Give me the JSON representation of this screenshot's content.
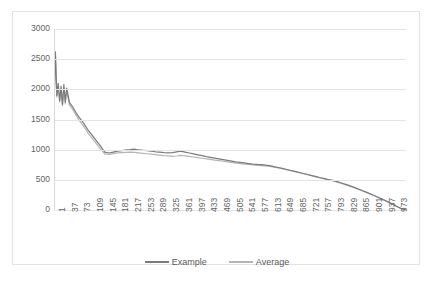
{
  "chart_data": {
    "type": "line",
    "title": "",
    "xlabel": "",
    "ylabel": "",
    "xlim": [
      1,
      1000
    ],
    "ylim": [
      0,
      3000
    ],
    "grid": true,
    "legend_position": "bottom",
    "y_ticks": [
      3000,
      2500,
      2000,
      1500,
      1000,
      500,
      0
    ],
    "x_ticks": [
      1,
      37,
      73,
      109,
      145,
      181,
      217,
      253,
      289,
      325,
      361,
      397,
      433,
      469,
      505,
      541,
      577,
      613,
      649,
      685,
      721,
      757,
      793,
      829,
      865,
      901,
      937,
      973
    ],
    "colors": {
      "example": "#7b7b7b",
      "average": "#b5b5b5",
      "grid": "#e4e4e4",
      "text": "#626262"
    },
    "series": [
      {
        "name": "Example",
        "color": "#7b7b7b",
        "x": [
          1,
          5,
          9,
          13,
          17,
          21,
          25,
          29,
          33,
          37,
          45,
          55,
          65,
          73,
          85,
          97,
          109,
          121,
          133,
          145,
          157,
          169,
          181,
          193,
          205,
          217,
          229,
          241,
          253,
          265,
          277,
          289,
          301,
          313,
          325,
          337,
          349,
          361,
          373,
          385,
          397,
          409,
          421,
          433,
          445,
          457,
          469,
          481,
          493,
          505,
          517,
          529,
          541,
          553,
          565,
          577,
          589,
          601,
          613,
          625,
          637,
          649,
          661,
          673,
          685,
          697,
          709,
          721,
          733,
          745,
          757,
          769,
          781,
          793,
          805,
          817,
          829,
          841,
          853,
          865,
          877,
          889,
          901,
          913,
          925,
          937,
          949,
          961,
          973,
          985,
          997,
          1000
        ],
        "values": [
          1730,
          2620,
          1900,
          2100,
          1810,
          2050,
          1750,
          2080,
          1790,
          2020,
          1780,
          1700,
          1600,
          1530,
          1440,
          1330,
          1240,
          1150,
          1060,
          960,
          945,
          960,
          975,
          985,
          995,
          1000,
          1010,
          995,
          990,
          985,
          975,
          965,
          960,
          952,
          948,
          950,
          962,
          975,
          960,
          945,
          930,
          915,
          900,
          885,
          872,
          860,
          848,
          835,
          822,
          810,
          798,
          790,
          780,
          770,
          760,
          755,
          752,
          745,
          735,
          720,
          705,
          690,
          672,
          655,
          640,
          622,
          605,
          588,
          570,
          552,
          535,
          520,
          502,
          490,
          470,
          448,
          425,
          400,
          375,
          348,
          320,
          292,
          262,
          232,
          200,
          168,
          135,
          100,
          62,
          28,
          5,
          0
        ]
      },
      {
        "name": "Average",
        "color": "#b5b5b5",
        "x": [
          1,
          5,
          9,
          13,
          17,
          21,
          25,
          29,
          33,
          37,
          45,
          55,
          65,
          73,
          85,
          97,
          109,
          121,
          133,
          145,
          157,
          169,
          181,
          193,
          205,
          217,
          229,
          241,
          253,
          265,
          277,
          289,
          301,
          313,
          325,
          337,
          349,
          361,
          373,
          385,
          397,
          409,
          421,
          433,
          445,
          457,
          469,
          481,
          493,
          505,
          517,
          529,
          541,
          553,
          565,
          577,
          589,
          601,
          613,
          625,
          637,
          649,
          661,
          673,
          685,
          697,
          709,
          721,
          733,
          745,
          757,
          769,
          781,
          793,
          805,
          817,
          829,
          841,
          853,
          865,
          877,
          889,
          901,
          913,
          925,
          937,
          949,
          961,
          973,
          985,
          997,
          1000
        ],
        "values": [
          1700,
          2560,
          1870,
          2050,
          1790,
          2000,
          1730,
          2030,
          1760,
          1980,
          1740,
          1660,
          1560,
          1480,
          1390,
          1280,
          1190,
          1100,
          1010,
          930,
          920,
          935,
          948,
          952,
          956,
          958,
          955,
          948,
          940,
          932,
          925,
          918,
          910,
          902,
          896,
          890,
          895,
          905,
          898,
          888,
          878,
          868,
          858,
          848,
          838,
          828,
          818,
          808,
          798,
          788,
          778,
          770,
          762,
          754,
          746,
          740,
          736,
          730,
          722,
          710,
          697,
          684,
          668,
          652,
          636,
          620,
          604,
          586,
          568,
          550,
          533,
          516,
          500,
          482,
          462,
          440,
          418,
          394,
          368,
          342,
          315,
          288,
          258,
          228,
          197,
          165,
          132,
          98,
          60,
          27,
          5,
          0
        ]
      }
    ]
  },
  "legend": {
    "items": [
      {
        "label": "Example",
        "color": "#7b7b7b"
      },
      {
        "label": "Average",
        "color": "#b5b5b5"
      }
    ]
  }
}
